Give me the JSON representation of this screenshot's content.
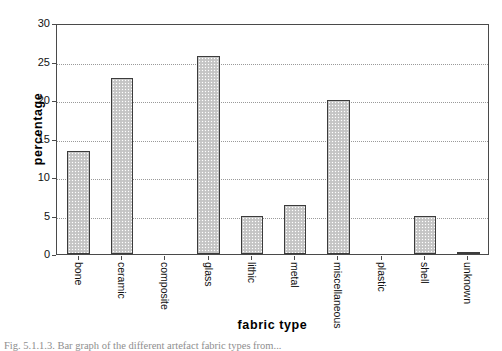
{
  "chart_data": {
    "type": "bar",
    "title": "",
    "xlabel": "fabric type",
    "ylabel": "percentage",
    "categories": [
      "bone",
      "ceramic",
      "composite",
      "glass",
      "lithic",
      "metal",
      "miscellaneous",
      "plastic",
      "shell",
      "unknown"
    ],
    "values": [
      13.4,
      22.8,
      0,
      25.7,
      5.0,
      6.4,
      20.0,
      0,
      5.0,
      0.3
    ],
    "ylim": [
      0,
      30
    ],
    "yticks": [
      0,
      5,
      10,
      15,
      20,
      25,
      30
    ],
    "ytick_labels": [
      "0",
      "5",
      "10",
      "15",
      "20",
      "25",
      "30"
    ],
    "grid": "horizontal-dotted",
    "legend": "none",
    "bar_fill": "#c9c9c9",
    "bar_edge": "#3c3c3c",
    "gridline_color": "#9a9a9a",
    "axis_color": "#4a4a4a"
  },
  "caption": {
    "text": "Fig. 5.1.1.3. Bar graph of the different artefact fabric types from..."
  }
}
